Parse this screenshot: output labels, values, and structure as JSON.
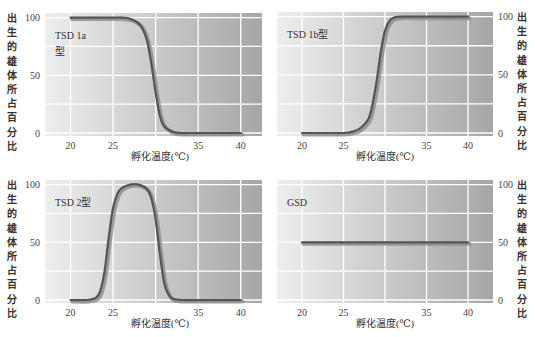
{
  "colors": {
    "bg_light": "#eeeeee",
    "bg_dark": "#a6a6a6",
    "grid": "#ffffff",
    "line": "#555555",
    "line_shadow": "#8a8a8a"
  },
  "chart_data": [
    {
      "type": "line",
      "title": "TSD 1a型",
      "title_lines": [
        "TSD  1a",
        "型"
      ],
      "xlabel": "孵化温度(℃)",
      "ylabel": "出生的雄体所占百分比",
      "ylabel_side": "left",
      "xticks": [
        20,
        25,
        35,
        40
      ],
      "yticks": [
        0,
        50,
        100
      ],
      "xlim": [
        17,
        42.5
      ],
      "ylim": [
        0,
        104
      ],
      "grid": true,
      "series": [
        {
          "name": "TSD 1a",
          "x": [
            20,
            22,
            24,
            26,
            27,
            28,
            28.5,
            29,
            29.5,
            30,
            30.5,
            31,
            32,
            33,
            34,
            36,
            38,
            40
          ],
          "y": [
            100,
            100,
            100,
            100,
            99,
            95,
            90,
            80,
            60,
            35,
            15,
            6,
            1,
            0,
            0,
            0,
            0,
            0
          ]
        }
      ]
    },
    {
      "type": "line",
      "title": "TSD 1b型",
      "title_lines": [
        "TSD 1b型"
      ],
      "xlabel": "孵化温度(℃)",
      "ylabel": "出生的雄体所占百分比",
      "ylabel_side": "right",
      "xticks": [
        20,
        25,
        35,
        40
      ],
      "yticks": [
        0,
        50,
        100
      ],
      "xlim": [
        17,
        43
      ],
      "ylim": [
        0,
        104
      ],
      "grid": true,
      "series": [
        {
          "name": "TSD 1b",
          "x": [
            20,
            22,
            24,
            25,
            26,
            27,
            28,
            28.5,
            29,
            29.5,
            30,
            30.5,
            31,
            32,
            33,
            35,
            37,
            40
          ],
          "y": [
            0,
            0,
            0,
            0,
            1,
            4,
            12,
            25,
            45,
            70,
            88,
            96,
            99,
            100,
            100,
            100,
            100,
            100
          ]
        }
      ]
    },
    {
      "type": "line",
      "title": "TSD 2型",
      "title_lines": [
        "TSD 2型"
      ],
      "xlabel": "孵化温度(℃)",
      "ylabel": "出生的雄体所占百分比",
      "ylabel_side": "left",
      "xticks": [
        20,
        25,
        35,
        40
      ],
      "yticks": [
        0,
        50,
        100
      ],
      "xlim": [
        17,
        42.5
      ],
      "ylim": [
        0,
        104
      ],
      "grid": true,
      "series": [
        {
          "name": "TSD 2",
          "x": [
            20,
            22,
            23,
            23.5,
            24,
            24.5,
            25,
            25.5,
            26,
            27,
            28,
            29,
            29.5,
            30,
            30.5,
            31,
            31.5,
            32,
            33,
            35,
            40
          ],
          "y": [
            0,
            0,
            2,
            8,
            25,
            55,
            80,
            92,
            97,
            100,
            100,
            96,
            88,
            70,
            40,
            15,
            5,
            1,
            0,
            0,
            0
          ]
        }
      ]
    },
    {
      "type": "line",
      "title": "GSD",
      "title_lines": [
        "GSD"
      ],
      "xlabel": "孵化温度(℃)",
      "ylabel": "出生的雄体所占百分比",
      "ylabel_side": "right",
      "xticks": [
        20,
        25,
        35,
        40
      ],
      "yticks": [
        0,
        50,
        100
      ],
      "xlim": [
        17,
        43
      ],
      "ylim": [
        0,
        104
      ],
      "grid": true,
      "series": [
        {
          "name": "GSD",
          "x": [
            20,
            40
          ],
          "y": [
            50,
            50
          ]
        }
      ]
    }
  ]
}
